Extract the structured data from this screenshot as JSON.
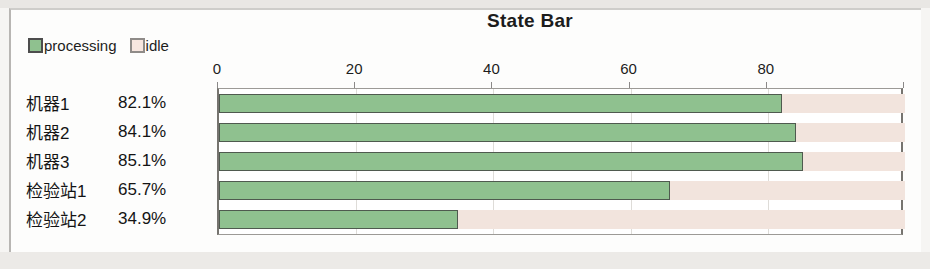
{
  "chart_data": {
    "type": "bar",
    "orientation": "horizontal",
    "stacked": true,
    "title": "State Bar",
    "xlabel": "",
    "ylabel": "",
    "xlim": [
      0,
      100
    ],
    "grid": true,
    "legend_position": "top-left",
    "tick_labels": [
      "0",
      "20",
      "40",
      "60",
      "80"
    ],
    "ticks": [
      0,
      20,
      40,
      60,
      80,
      100
    ],
    "categories": [
      "机器1",
      "机器2",
      "机器3",
      "检验站1",
      "检验站2"
    ],
    "value_labels": [
      "82.1%",
      "84.1%",
      "85.1%",
      "65.7%",
      "34.9%"
    ],
    "series": [
      {
        "name": "processing",
        "color": "#8fc18f",
        "values": [
          82.1,
          84.1,
          85.1,
          65.7,
          34.9
        ]
      },
      {
        "name": "idle",
        "color": "#f2e4dd",
        "values": [
          17.9,
          15.9,
          14.9,
          34.3,
          65.1
        ]
      }
    ]
  },
  "legend": {
    "entries": [
      {
        "label": "processing",
        "swatch": "processing"
      },
      {
        "label": "idle",
        "swatch": "idle"
      }
    ]
  },
  "rows": [
    {
      "name": "机器1",
      "value": "82.1%"
    },
    {
      "name": "机器2",
      "value": "84.1%"
    },
    {
      "name": "机器3",
      "value": "85.1%"
    },
    {
      "name": "检验站1",
      "value": "65.7%"
    },
    {
      "name": "检验站2",
      "value": "34.9%"
    }
  ],
  "colors": {
    "processing_fill": "#8fc18f",
    "processing_border": "#4f5a4f",
    "idle_fill": "#f2e4dd",
    "plot_border": "#76746f",
    "text": "#1c1c1c"
  }
}
